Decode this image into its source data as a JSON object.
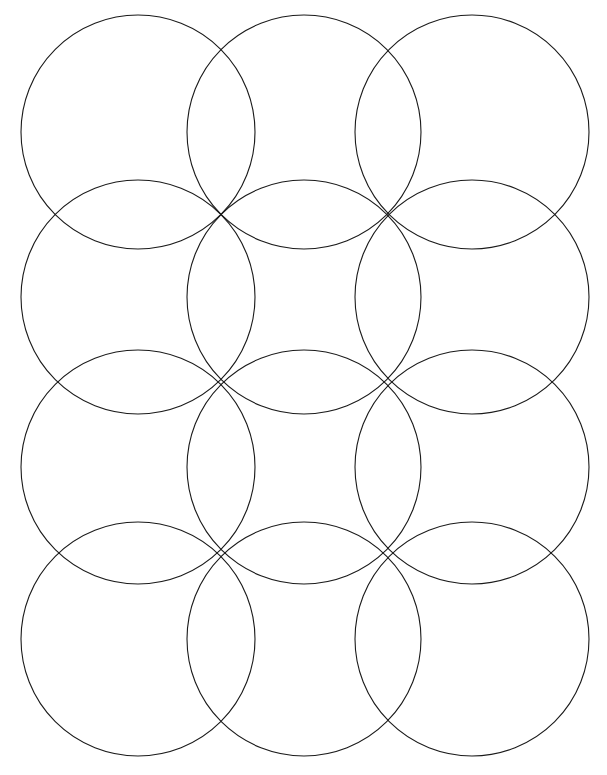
{
  "figure": {
    "title": "Overlapping Circle Lattice Pattern",
    "kind": "geometric-line-drawing",
    "background_color": "#ffffff",
    "stroke_color": "#1a1a1a",
    "stroke_width": 1.1,
    "canvas": {
      "width": 607,
      "height": 775
    },
    "geometry": {
      "radius": 117,
      "columns": 4,
      "rows": 5,
      "node_x": [
        57,
        220,
        388,
        556
      ],
      "node_y": [
        49,
        215,
        380,
        555,
        723
      ],
      "center_x": [
        138,
        304,
        472,
        30,
        614
      ],
      "center_y": [
        132,
        297,
        467,
        639,
        -35
      ]
    },
    "circles": [
      {
        "cx": 138,
        "cy": 132,
        "r": 117
      },
      {
        "cx": 304,
        "cy": 132,
        "r": 117
      },
      {
        "cx": 472,
        "cy": 132,
        "r": 117
      },
      {
        "cx": 138,
        "cy": 297,
        "r": 117
      },
      {
        "cx": 304,
        "cy": 297,
        "r": 117
      },
      {
        "cx": 472,
        "cy": 297,
        "r": 117
      },
      {
        "cx": 138,
        "cy": 467,
        "r": 117
      },
      {
        "cx": 304,
        "cy": 467,
        "r": 117
      },
      {
        "cx": 472,
        "cy": 467,
        "r": 117
      },
      {
        "cx": 138,
        "cy": 639,
        "r": 117
      },
      {
        "cx": 304,
        "cy": 639,
        "r": 117
      },
      {
        "cx": 472,
        "cy": 639,
        "r": 117
      }
    ]
  },
  "chart_data": {
    "type": "scatter",
    "title": "Overlapping Circle Lattice Pattern",
    "xlabel": "",
    "ylabel": "",
    "xlim": [
      0,
      607
    ],
    "ylim": [
      0,
      775
    ],
    "grid": false,
    "legend": "none",
    "series": [
      {
        "name": "circle-centers",
        "radius": 117,
        "points": [
          [
            138,
            132
          ],
          [
            304,
            132
          ],
          [
            472,
            132
          ],
          [
            138,
            297
          ],
          [
            304,
            297
          ],
          [
            472,
            297
          ],
          [
            138,
            467
          ],
          [
            304,
            467
          ],
          [
            472,
            467
          ],
          [
            138,
            639
          ],
          [
            304,
            639
          ],
          [
            472,
            639
          ]
        ]
      },
      {
        "name": "intersection-nodes",
        "points": [
          [
            57,
            49
          ],
          [
            220,
            49
          ],
          [
            388,
            49
          ],
          [
            556,
            49
          ],
          [
            57,
            215
          ],
          [
            220,
            215
          ],
          [
            388,
            215
          ],
          [
            556,
            215
          ],
          [
            57,
            380
          ],
          [
            220,
            380
          ],
          [
            388,
            380
          ],
          [
            556,
            380
          ],
          [
            57,
            555
          ],
          [
            220,
            555
          ],
          [
            388,
            555
          ],
          [
            556,
            555
          ],
          [
            57,
            723
          ],
          [
            220,
            723
          ],
          [
            388,
            723
          ],
          [
            556,
            723
          ]
        ]
      }
    ]
  }
}
